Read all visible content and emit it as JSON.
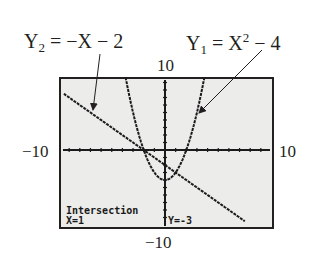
{
  "chart_data": {
    "type": "line",
    "title": "",
    "window": {
      "xmin": -10,
      "xmax": 10,
      "ymin": -10,
      "ymax": 10,
      "xscl": 1,
      "yscl": 1
    },
    "tick_labels": {
      "ymax": "10",
      "xmin": "−10",
      "xmax": "10",
      "ymin": "−10"
    },
    "series": [
      {
        "name": "Y1",
        "equation": "Y1 = X^2 - 4",
        "label_main": "Y",
        "label_sub": "1",
        "label_rest": " = X",
        "label_sup": "2",
        "label_tail": " − 4",
        "kind": "quadratic",
        "a": 1,
        "b": 0,
        "c": -4
      },
      {
        "name": "Y2",
        "equation": "Y2 = -X - 2",
        "label_main": "Y",
        "label_sub": "2",
        "label_rest": " = −X − 2",
        "kind": "linear",
        "m": -1,
        "k": -2
      }
    ],
    "intersections": [
      {
        "x": -1,
        "y": -1
      },
      {
        "x": 1,
        "y": -3
      }
    ],
    "annotation": {
      "title": "Intersection",
      "x_text": "X=1",
      "y_text": "Y=-3"
    },
    "colors": {
      "screen_bg": "#ececea",
      "ink": "#1a1a1a",
      "frame": "#231f20"
    }
  }
}
